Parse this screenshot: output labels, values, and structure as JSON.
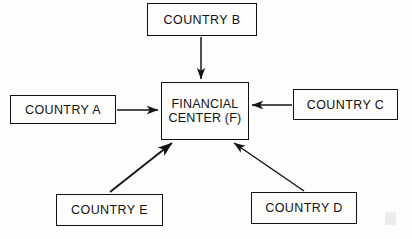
{
  "diagram": {
    "type": "hub-and-spoke",
    "background_color": "#fdfdfc",
    "ink_color": "#111111",
    "nodes": {
      "center": {
        "id": "F",
        "label": "FINANCIAL\nCENTER (F)",
        "x": 161,
        "y": 82,
        "width": 88,
        "height": 58
      },
      "country_a": {
        "id": "A",
        "label": "COUNTRY A",
        "x": 10,
        "y": 95,
        "width": 106,
        "height": 29
      },
      "country_b": {
        "id": "B",
        "label": "COUNTRY B",
        "x": 147,
        "y": 3,
        "width": 110,
        "height": 33
      },
      "country_c": {
        "id": "C",
        "label": "COUNTRY C",
        "x": 293,
        "y": 89,
        "width": 105,
        "height": 31
      },
      "country_d": {
        "id": "D",
        "label": "COUNTRY D",
        "x": 251,
        "y": 192,
        "width": 106,
        "height": 32
      },
      "country_e": {
        "id": "E",
        "label": "COUNTRY E",
        "x": 56,
        "y": 194,
        "width": 107,
        "height": 32
      }
    },
    "edges": [
      {
        "from": "B",
        "to": "F",
        "direction": "down",
        "x1": 201,
        "y1": 37,
        "x2": 201,
        "y2": 80
      },
      {
        "from": "A",
        "to": "F",
        "direction": "right",
        "x1": 117,
        "y1": 110,
        "x2": 159,
        "y2": 110
      },
      {
        "from": "C",
        "to": "F",
        "direction": "left",
        "x1": 292,
        "y1": 105,
        "x2": 251,
        "y2": 105
      },
      {
        "from": "E",
        "to": "F",
        "direction": "up-right",
        "x1": 110,
        "y1": 192,
        "x2": 173,
        "y2": 142
      },
      {
        "from": "D",
        "to": "F",
        "direction": "up-left",
        "x1": 304,
        "y1": 191,
        "x2": 233,
        "y2": 142
      }
    ]
  }
}
